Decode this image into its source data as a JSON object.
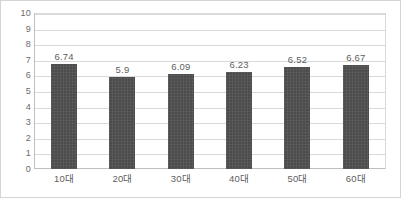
{
  "chart_data": {
    "type": "bar",
    "title": "",
    "subtitle": "",
    "xlabel": "",
    "ylabel": "",
    "categories": [
      "10대",
      "20대",
      "30대",
      "40대",
      "50대",
      "60대"
    ],
    "values": [
      6.74,
      5.9,
      6.09,
      6.23,
      6.52,
      6.67
    ],
    "data_labels": [
      "6.74",
      "5.9",
      "6.09",
      "6.23",
      "6.52",
      "6.67"
    ],
    "ylim": [
      0,
      10
    ],
    "ytick_step": 1,
    "ytick_labels": [
      "10",
      "9",
      "8",
      "7",
      "6",
      "5",
      "4",
      "3",
      "2",
      "1",
      "0"
    ],
    "grid": true,
    "grid_axis": "y",
    "legend": false,
    "legend_position": "none",
    "series": [
      {
        "name": "",
        "values": [
          6.74,
          5.9,
          6.09,
          6.23,
          6.52,
          6.67
        ]
      }
    ],
    "colors": {
      "bar": "#4c4c4c",
      "gridline": "#d9d9d9",
      "axis": "#bfbfbf",
      "tick_text": "#6a6a6a",
      "label_text": "#5e5e5e",
      "plot_background": "#ffffff",
      "border": "#d4d4d4"
    }
  }
}
